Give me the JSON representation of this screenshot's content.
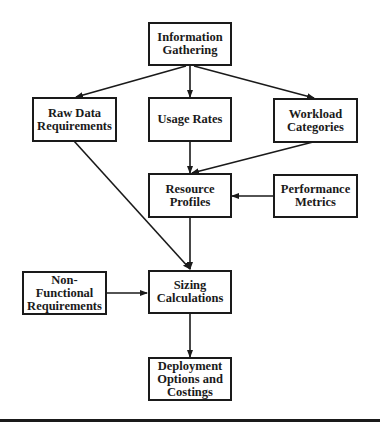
{
  "diagram": {
    "type": "flowchart",
    "nodes": {
      "info_gathering": {
        "label": "Information\nGathering"
      },
      "raw_data": {
        "label": "Raw Data\nRequirements"
      },
      "usage_rates": {
        "label": "Usage Rates"
      },
      "workload": {
        "label": "Workload\nCategories"
      },
      "resource_profiles": {
        "label": "Resource Profiles"
      },
      "performance": {
        "label": "Performance\nMetrics"
      },
      "non_functional": {
        "label": "Non-Functional\nRequirements"
      },
      "sizing": {
        "label": "Sizing\nCalculations"
      },
      "deployment": {
        "label": "Deployment\nOptions and\nCostings"
      }
    },
    "edges": [
      {
        "from": "Information Gathering",
        "to": "Raw Data Requirements"
      },
      {
        "from": "Information Gathering",
        "to": "Usage Rates"
      },
      {
        "from": "Information Gathering",
        "to": "Workload Categories"
      },
      {
        "from": "Usage Rates",
        "to": "Resource Profiles"
      },
      {
        "from": "Workload Categories",
        "to": "Resource Profiles"
      },
      {
        "from": "Performance Metrics",
        "to": "Resource Profiles"
      },
      {
        "from": "Raw Data Requirements",
        "to": "Sizing Calculations"
      },
      {
        "from": "Resource Profiles",
        "to": "Sizing Calculations"
      },
      {
        "from": "Non-Functional Requirements",
        "to": "Sizing Calculations"
      },
      {
        "from": "Sizing Calculations",
        "to": "Deployment Options and Costings"
      }
    ],
    "colors": {
      "stroke": "#1a1a1a",
      "background": "#ffffff"
    }
  }
}
